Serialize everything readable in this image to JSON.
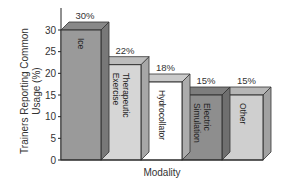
{
  "chart_data": {
    "type": "bar",
    "style": "3d",
    "title": "",
    "xlabel": "Modality",
    "ylabel": "Trainers Reporting Common Usage (%)",
    "ylim": [
      0,
      30
    ],
    "yticks": [
      0,
      5,
      10,
      15,
      20,
      25,
      30
    ],
    "grid": false,
    "legend": null,
    "categories": [
      "Ice",
      "Therapeutic Exercise",
      "Hydrocollator",
      "Electric Simulation",
      "Other"
    ],
    "values": [
      30,
      22,
      18,
      15,
      15
    ],
    "value_labels": [
      "30%",
      "22%",
      "18%",
      "15%",
      "15%"
    ],
    "bar_colors": [
      "#9a9a9a",
      "#d6d6d6",
      "#ffffff",
      "#8e8e8e",
      "#cfcfcf"
    ]
  },
  "labels": {
    "xlabel": "Modality",
    "ylabel_line1": "Trainers Reporting Common",
    "ylabel_line2": "Usage (%)",
    "bar_text": [
      [
        "Ice"
      ],
      [
        "Therapeutic",
        "Exercise"
      ],
      [
        "Hydrocollator"
      ],
      [
        "Electric",
        "Simulation"
      ],
      [
        "Other"
      ]
    ]
  }
}
